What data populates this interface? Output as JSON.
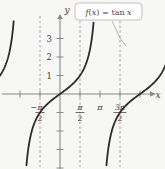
{
  "figure": {
    "background_color": "#f7f7f5",
    "width": 165,
    "height": 169
  },
  "callout": {
    "text": "f(x) = tan x",
    "parts": {
      "f": "f",
      "open": "(",
      "var": "x",
      "close": ")",
      "equals": "=",
      "fn": "tan",
      "arg": "x"
    },
    "box_color": "#ffffff",
    "border_color": "#b9b9b9",
    "text_color": "#4a4a4a"
  },
  "axes": {
    "x_label": "x",
    "y_label": "y",
    "axis_color": "#8a8a8a",
    "origin_px": {
      "x": 60,
      "y": 94
    },
    "x_unit_px_half_pi": 40,
    "y_unit_px": 18.5
  },
  "chart_data": {
    "type": "line",
    "xlabel": "x",
    "ylabel": "y",
    "grid": false,
    "legend": "none",
    "annotations": [
      {
        "text": "f(x) = tan x",
        "kind": "callout",
        "points_to_curve": true
      }
    ],
    "xlim": [
      -2.748,
      5.105
    ],
    "ylim": [
      -4.0,
      4.0
    ],
    "x_ticks": [
      {
        "value": -1.5708,
        "label": "-π/2",
        "numerator": "π",
        "denominator": "2",
        "negative": true,
        "fraction": true
      },
      {
        "value": 1.5708,
        "label": "π/2",
        "numerator": "π",
        "denominator": "2",
        "negative": false,
        "fraction": true
      },
      {
        "value": 3.1416,
        "label": "π",
        "numerator": "π",
        "denominator": "",
        "negative": false,
        "fraction": false
      },
      {
        "value": 4.7124,
        "label": "3π/2",
        "numerator": "3π",
        "denominator": "2",
        "negative": false,
        "fraction": true
      }
    ],
    "y_ticks": [
      {
        "value": 3,
        "label": "3"
      },
      {
        "value": 2,
        "label": "2"
      },
      {
        "value": 1,
        "label": "1"
      },
      {
        "value": -1,
        "label": ""
      },
      {
        "value": -2,
        "label": ""
      },
      {
        "value": -3,
        "label": ""
      },
      {
        "value": -4,
        "label": ""
      }
    ],
    "asymptotes": {
      "style": "dashed",
      "color": "#9a9a9a",
      "x_values": [
        -1.5708,
        1.5708,
        4.7124
      ]
    },
    "curve": {
      "name": "tan x",
      "color": "#2b2b2b",
      "width_px": 1.8,
      "branches": [
        {
          "domain": [
            -2.748,
            -1.5708
          ],
          "note": "left partial branch rising from below toward asymptote at -pi/2"
        },
        {
          "domain": [
            -1.5708,
            1.5708
          ],
          "note": "full principal branch through origin"
        },
        {
          "domain": [
            1.5708,
            4.7124
          ],
          "note": "full branch through x = pi"
        },
        {
          "domain": [
            4.7124,
            5.105
          ],
          "note": "right partial branch rising from asymptote at 3pi/2"
        }
      ],
      "samples_note": "y = tan(x), clipped to |y| <= 4"
    }
  }
}
